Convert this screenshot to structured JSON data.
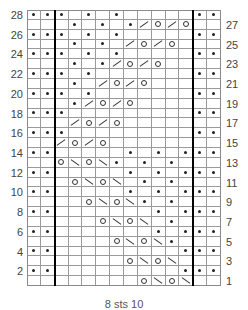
{
  "chart": {
    "columns": 14,
    "rows": 28,
    "colors": {
      "grid": "#9a9a9a",
      "thick_line": "#000000",
      "symbol": "#222222",
      "label": "#444444"
    },
    "thick_line_after_columns": [
      2,
      12
    ],
    "legend": {
      "dot": "purl-icon",
      "o": "yarn-over-icon",
      "/": "k2tog-icon",
      "\\": "ssk-icon"
    },
    "row_data": {
      "28": {
        "0": "dot",
        "1": "dot",
        "2": "dot",
        "4": "dot",
        "6": "dot",
        "12": "dot",
        "13": "dot"
      },
      "27": {
        "3": "dot",
        "5": "dot",
        "7": "dot",
        "8": "/",
        "9": "o",
        "10": "/",
        "11": "o"
      },
      "26": {
        "0": "dot",
        "1": "dot",
        "2": "dot",
        "4": "dot",
        "6": "dot",
        "12": "dot",
        "13": "dot"
      },
      "25": {
        "3": "dot",
        "5": "dot",
        "7": "/",
        "8": "o",
        "9": "/",
        "10": "o"
      },
      "24": {
        "0": "dot",
        "1": "dot",
        "2": "dot",
        "4": "dot",
        "6": "dot",
        "12": "dot",
        "13": "dot"
      },
      "23": {
        "3": "dot",
        "5": "dot",
        "6": "/",
        "7": "o",
        "8": "/",
        "9": "o"
      },
      "22": {
        "0": "dot",
        "1": "dot",
        "2": "dot",
        "4": "dot",
        "12": "dot",
        "13": "dot"
      },
      "21": {
        "3": "dot",
        "5": "/",
        "6": "o",
        "7": "/",
        "8": "o"
      },
      "20": {
        "0": "dot",
        "1": "dot",
        "2": "dot",
        "4": "dot",
        "12": "dot",
        "13": "dot"
      },
      "19": {
        "3": "dot",
        "4": "/",
        "5": "o",
        "6": "/",
        "7": "o"
      },
      "18": {
        "0": "dot",
        "1": "dot",
        "2": "dot",
        "12": "dot",
        "13": "dot"
      },
      "17": {
        "3": "/",
        "4": "o",
        "5": "/",
        "6": "o"
      },
      "16": {
        "0": "dot",
        "1": "dot",
        "2": "dot",
        "12": "dot",
        "13": "dot"
      },
      "15": {
        "2": "/",
        "3": "o",
        "4": "/",
        "5": "o"
      },
      "14": {
        "0": "dot",
        "1": "dot",
        "7": "dot",
        "9": "dot",
        "11": "dot",
        "12": "dot",
        "13": "dot"
      },
      "13": {
        "2": "o",
        "3": "\\",
        "4": "o",
        "5": "\\",
        "6": "dot",
        "8": "dot",
        "10": "dot"
      },
      "12": {
        "0": "dot",
        "1": "dot",
        "7": "dot",
        "9": "dot",
        "11": "dot",
        "12": "dot",
        "13": "dot"
      },
      "11": {
        "3": "o",
        "4": "\\",
        "5": "o",
        "6": "\\",
        "8": "dot",
        "10": "dot"
      },
      "10": {
        "0": "dot",
        "1": "dot",
        "7": "dot",
        "9": "dot",
        "11": "dot",
        "12": "dot",
        "13": "dot"
      },
      "9": {
        "4": "o",
        "5": "\\",
        "6": "o",
        "7": "\\",
        "8": "dot",
        "10": "dot"
      },
      "8": {
        "0": "dot",
        "1": "dot",
        "9": "dot",
        "11": "dot",
        "12": "dot",
        "13": "dot"
      },
      "7": {
        "5": "o",
        "6": "\\",
        "7": "o",
        "8": "\\",
        "10": "dot"
      },
      "6": {
        "0": "dot",
        "1": "dot",
        "9": "dot",
        "11": "dot",
        "12": "dot",
        "13": "dot"
      },
      "5": {
        "6": "o",
        "7": "\\",
        "8": "o",
        "9": "\\",
        "10": "dot"
      },
      "4": {
        "0": "dot",
        "1": "dot",
        "11": "dot",
        "12": "dot",
        "13": "dot"
      },
      "3": {
        "7": "o",
        "8": "\\",
        "9": "o",
        "10": "\\"
      },
      "2": {
        "0": "dot",
        "1": "dot",
        "11": "dot",
        "12": "dot",
        "13": "dot"
      },
      "1": {
        "8": "o",
        "9": "\\",
        "10": "o",
        "11": "\\"
      }
    },
    "left_labels": [
      "28",
      "26",
      "24",
      "22",
      "20",
      "18",
      "16",
      "14",
      "12",
      "10",
      "8",
      "6",
      "4",
      "2"
    ],
    "right_labels": [
      "27",
      "25",
      "23",
      "21",
      "19",
      "17",
      "15",
      "13",
      "11",
      "9",
      "7",
      "5",
      "3",
      "1"
    ],
    "caption": "8 sts 10"
  }
}
